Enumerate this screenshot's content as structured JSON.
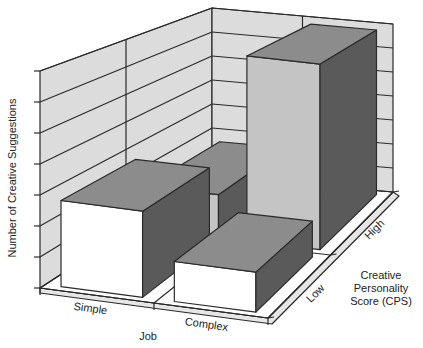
{
  "chart_data": {
    "type": "bar",
    "subtype": "3d-grouped-bar",
    "title": "",
    "xlabel": "Job",
    "ylabel": "Number of Creative Suggestions",
    "zlabel": "Creative Personality Score (CPS)",
    "categories": [
      "Simple",
      "Complex"
    ],
    "depth_categories": [
      "Low",
      "High"
    ],
    "series": [
      {
        "name": "Low",
        "values": [
          2.8,
          1.3
        ]
      },
      {
        "name": "High",
        "values": [
          1.6,
          6.8
        ]
      }
    ],
    "ylim": [
      0,
      7
    ],
    "y_tick_count": 8,
    "y_tick_labels_shown": false,
    "grid": true,
    "legend": "none"
  },
  "labels": {
    "y_axis": "Number of Creative Suggestions",
    "x_axis": "Job",
    "x_ticks": [
      "Simple",
      "Complex"
    ],
    "z_axis_lines": [
      "Creative",
      "Personality",
      "Score (CPS)"
    ],
    "z_ticks": [
      "Low",
      "High"
    ]
  },
  "colors": {
    "wall": "#dcdcdc",
    "floor": "#ffffff",
    "grid": "#2a2a2a",
    "low_front": "#ffffff",
    "low_top": "#8c8c8c",
    "low_side": "#5a5a5a",
    "high_front": "#c4c4c4",
    "high_top": "#8c8c8c",
    "high_side": "#5a5a5a"
  }
}
